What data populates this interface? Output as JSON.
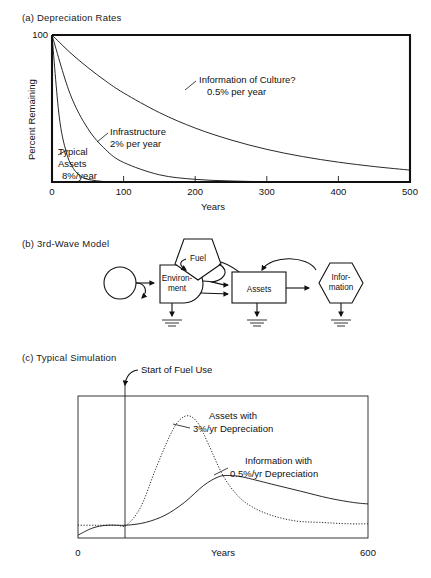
{
  "figure": {
    "panels": [
      {
        "id": "a",
        "title": "(a) Depreciation Rates"
      },
      {
        "id": "b",
        "title": "(b) 3rd-Wave Model"
      },
      {
        "id": "c",
        "title": "(c) Typical Simulation"
      }
    ]
  },
  "panel_a": {
    "ylabel": "Percent Remaining",
    "xlabel": "Years",
    "ytick_top": "100",
    "xticks": [
      "0",
      "100",
      "200",
      "300",
      "400",
      "500"
    ],
    "annotations": [
      {
        "line1": "Information of Culture?",
        "line2": "0.5% per year"
      },
      {
        "line1": "Infrastructure",
        "line2": "2% per year"
      },
      {
        "line1": "Typical",
        "line2": "Assets",
        "line3": "8%/year"
      }
    ]
  },
  "panel_b": {
    "nodes": [
      {
        "name": "source",
        "label": ""
      },
      {
        "name": "environment",
        "label_line1": "Environ-",
        "label_line2": "ment"
      },
      {
        "name": "fuel",
        "label": "Fuel"
      },
      {
        "name": "assets",
        "label": "Assets"
      },
      {
        "name": "information",
        "label_line1": "Infor-",
        "label_line2": "mation"
      }
    ]
  },
  "panel_c": {
    "xlabel": "Years",
    "xticks": [
      "0",
      "600"
    ],
    "marker_label": "Start of Fuel Use",
    "annotations": [
      {
        "line1": "Assets with",
        "line2": "3%/yr Depreciation"
      },
      {
        "line1": "Information with",
        "line2": "0.5%/yr Depreciation"
      }
    ]
  },
  "chart_data": [
    {
      "type": "line",
      "id": "panel-a",
      "title": "(a) Depreciation Rates",
      "xlabel": "Years",
      "ylabel": "Percent Remaining",
      "xlim": [
        0,
        500
      ],
      "ylim": [
        0,
        100
      ],
      "xticks": [
        0,
        100,
        200,
        300,
        400,
        500
      ],
      "yticks": [
        100
      ],
      "grid": false,
      "legend": "inline-annotations",
      "series": [
        {
          "name": "Information of Culture? 0.5% per year",
          "rate_percent_per_year": 0.5,
          "x": [
            0,
            25,
            50,
            75,
            100,
            150,
            200,
            250,
            300,
            350,
            400,
            450,
            500
          ],
          "values": [
            100,
            88.2,
            77.9,
            68.7,
            60.6,
            47.2,
            36.7,
            28.6,
            22.2,
            17.3,
            13.5,
            10.5,
            8.1
          ]
        },
        {
          "name": "Infrastructure 2% per year",
          "rate_percent_per_year": 2,
          "x": [
            0,
            25,
            50,
            75,
            100,
            150,
            200,
            250,
            300,
            350,
            400,
            450,
            500
          ],
          "values": [
            100,
            60.3,
            36.4,
            22.0,
            13.3,
            4.9,
            1.8,
            0.7,
            0.2,
            0.1,
            0.0,
            0.0,
            0.0
          ]
        },
        {
          "name": "Typical Assets 8%/year",
          "rate_percent_per_year": 8,
          "x": [
            0,
            10,
            20,
            30,
            40,
            50,
            75,
            100,
            150,
            200,
            300,
            400,
            500
          ],
          "values": [
            100,
            44.9,
            20.2,
            9.1,
            4.1,
            1.8,
            0.2,
            0.0,
            0.0,
            0.0,
            0.0,
            0.0,
            0.0
          ]
        }
      ]
    },
    {
      "type": "line",
      "id": "panel-c",
      "title": "(c) Typical Simulation",
      "xlabel": "Years",
      "ylabel": "",
      "xlim": [
        0,
        600
      ],
      "ylim": [
        0,
        100
      ],
      "xticks": [
        0,
        600
      ],
      "yticks": [],
      "grid": false,
      "annotations": [
        {
          "text": "Start of Fuel Use",
          "x": 100
        }
      ],
      "series": [
        {
          "name": "Assets with 3%/yr Depreciation",
          "style": "dotted",
          "x": [
            0,
            40,
            80,
            100,
            130,
            160,
            190,
            210,
            230,
            250,
            270,
            300,
            330,
            360,
            400,
            450,
            500,
            560,
            600
          ],
          "values": [
            9,
            9,
            9,
            9,
            22,
            48,
            72,
            83,
            86,
            80,
            66,
            44,
            30,
            22,
            16,
            12,
            11,
            10,
            10
          ]
        },
        {
          "name": "Information with 0.5%/yr Depreciation",
          "style": "solid",
          "x": [
            0,
            30,
            60,
            100,
            140,
            180,
            220,
            260,
            290,
            310,
            340,
            400,
            460,
            520,
            570,
            600
          ],
          "values": [
            2,
            7,
            9,
            9,
            11,
            16,
            25,
            37,
            43,
            44,
            43,
            38,
            33,
            28,
            25,
            24
          ]
        }
      ]
    }
  ]
}
